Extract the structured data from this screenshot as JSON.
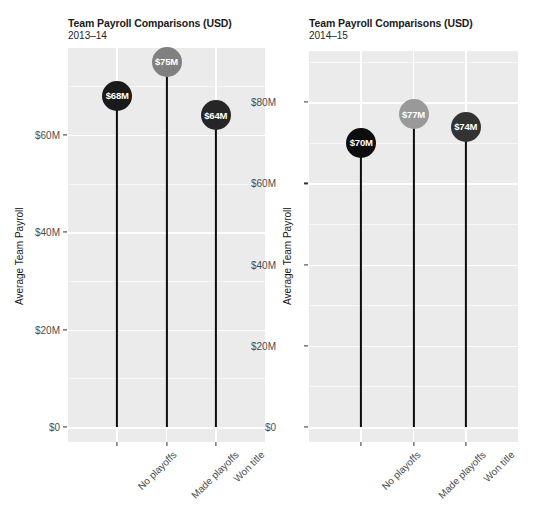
{
  "chart_data": [
    {
      "id": "left",
      "type": "bar",
      "title": "Team Payroll Comparisons (USD)",
      "subtitle": "2013–14",
      "xlabel": "",
      "ylabel": "Average Team Payroll",
      "categories": [
        "No playoffs",
        "Made playoffs",
        "Won title"
      ],
      "values": [
        68,
        75,
        64
      ],
      "labels": [
        "$68M",
        "$75M",
        "$64M"
      ],
      "point_colors": [
        "#1a1a1a",
        "#808080",
        "#262626"
      ],
      "ytick_labels": [
        "$0",
        "$20M",
        "$40M",
        "$60M"
      ],
      "ytick_values": [
        0,
        20,
        40,
        60
      ],
      "ylim": [
        0,
        81
      ],
      "grid": true,
      "panel_color": "#ebebeb",
      "grid_color": "#ffffff"
    },
    {
      "id": "right",
      "type": "bar",
      "title": "Team Payroll Comparisons (USD)",
      "subtitle": "2014–15",
      "xlabel": "",
      "ylabel": "Average Team Payroll",
      "categories": [
        "No playoffs",
        "Made playoffs",
        "Won title"
      ],
      "values": [
        70,
        77,
        74
      ],
      "labels": [
        "$70M",
        "$77M",
        "$74M"
      ],
      "point_colors": [
        "#0d0d0d",
        "#999999",
        "#333333"
      ],
      "ytick_labels": [
        "$0",
        "$20M",
        "$40M",
        "$60M",
        "$80M"
      ],
      "ytick_values": [
        0,
        20,
        40,
        60,
        80
      ],
      "ylim": [
        0,
        80
      ],
      "grid": true,
      "panel_color": "#ebebeb",
      "grid_color": "#ffffff"
    }
  ]
}
